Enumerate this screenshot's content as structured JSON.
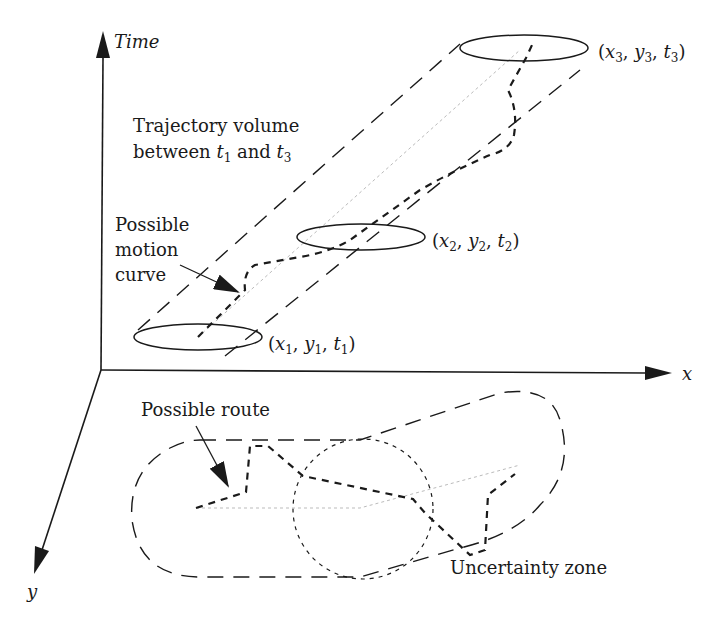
{
  "axes": {
    "time_label": "Time",
    "x_label": "x",
    "y_label": "y"
  },
  "labels": {
    "trajectory_volume_line1": "Trajectory volume",
    "trajectory_volume_line2_prefix": "between ",
    "trajectory_volume_t_start": "t",
    "trajectory_volume_t_start_sub": "1",
    "trajectory_volume_and": " and ",
    "trajectory_volume_t_end": "t",
    "trajectory_volume_t_end_sub": "3",
    "motion_curve_line1": "Possible",
    "motion_curve_line2": "motion",
    "motion_curve_line3": "curve",
    "possible_route": "Possible route",
    "uncertainty_zone": "Uncertainty zone"
  },
  "points": [
    {
      "name": "p1",
      "x": "x",
      "x_sub": "1",
      "y": "y",
      "y_sub": "1",
      "t": "t",
      "t_sub": "1"
    },
    {
      "name": "p2",
      "x": "x",
      "x_sub": "2",
      "y": "y",
      "y_sub": "2",
      "t": "t",
      "t_sub": "2"
    },
    {
      "name": "p3",
      "x": "x",
      "x_sub": "3",
      "y": "y",
      "y_sub": "3",
      "t": "t",
      "t_sub": "3"
    }
  ],
  "colors": {
    "line": "#1a1a1a",
    "faint": "#bbbbbb"
  }
}
